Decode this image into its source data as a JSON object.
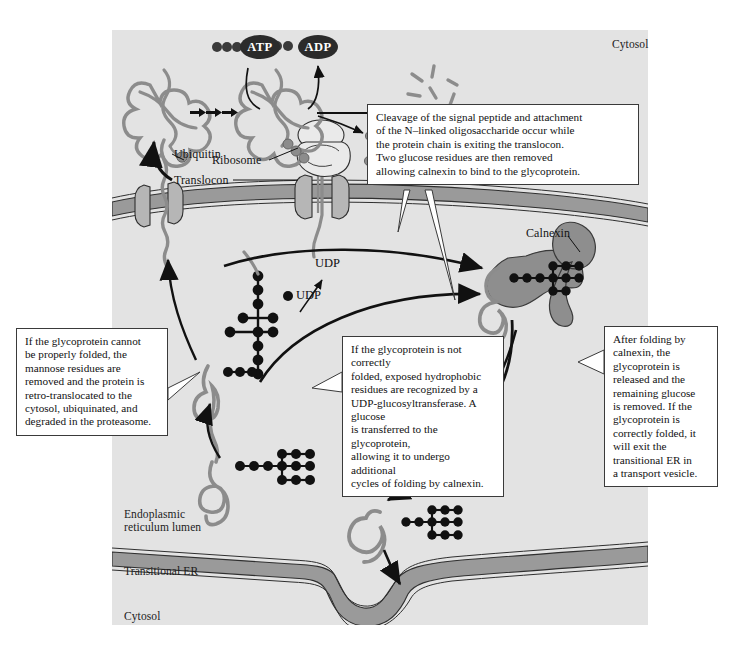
{
  "figure": {
    "panel_bg": "#e3e3e3",
    "membrane_fill": "#9a9a9a",
    "protein_stroke": "#8c8c8c",
    "calnexin_fill": "#8e8e8e",
    "sugar_color": "#111111",
    "line_color": "#111111"
  },
  "regions": [
    {
      "name": "cytosol-top",
      "label": "Cytosol"
    },
    {
      "name": "er-lumen",
      "label": "Endoplasmic\nreticulum lumen"
    },
    {
      "name": "transitional-er",
      "label": "Transitional ER"
    },
    {
      "name": "cytosol-bottom",
      "label": "Cytosol"
    }
  ],
  "parts": [
    {
      "name": "ubiquitin",
      "label": "Ubiquitin"
    },
    {
      "name": "ribosome",
      "label": "Ribosome"
    },
    {
      "name": "translocon",
      "label": "Translocon"
    },
    {
      "name": "calnexin",
      "label": "Calnexin"
    }
  ],
  "molecules": [
    {
      "name": "atp",
      "label": "ATP"
    },
    {
      "name": "adp",
      "label": "ADP"
    },
    {
      "name": "udp-free",
      "label": "UDP"
    },
    {
      "name": "udp-released",
      "label": "UDP"
    }
  ],
  "callouts": {
    "top": {
      "name": "callout-signal-peptide-cleavage",
      "lines": [
        "Cleavage of the signal peptide and attachment",
        "of the N–linked oligosaccharide occur while",
        "the protein chain is exiting the translocon.",
        "Two glucose residues are then removed",
        "allowing calnexin to bind to the glycoprotein."
      ],
      "text": "Cleavage of the signal peptide and attachment of the N–linked oligosaccharide occur while the protein chain is exiting the translocon. Two glucose residues are then removed allowing calnexin to bind to the glycoprotein."
    },
    "left": {
      "name": "callout-erad-degradation",
      "lines": [
        "If the glycoprotein cannot",
        "be properly folded, the",
        "mannose residues are",
        "removed and the protein is",
        "retro-translocated to the",
        "cytosol, ubiquinated, and",
        "degraded in the proteasome."
      ],
      "text": "If the glycoprotein cannot be properly folded, the mannose residues are removed and the protein is retro-translocated to the cytosol, ubiquinated, and degraded in the proteasome."
    },
    "center": {
      "name": "callout-udp-glucosyltransferase",
      "lines": [
        "If the glycoprotein is not correctly",
        "folded, exposed hydrophobic",
        "residues are recognized by a",
        "UDP-glucosyltransferase. A glucose",
        "is transferred to the glycoprotein,",
        "allowing it to undergo additional",
        "cycles of folding by calnexin."
      ],
      "text": "If the glycoprotein is not correctly folded, exposed hydrophobic residues are recognized by a UDP-glucosyltransferase. A glucose is transferred to the glycoprotein, allowing it to undergo additional cycles of folding by calnexin."
    },
    "right": {
      "name": "callout-transport-vesicle-exit",
      "lines": [
        "After folding by",
        "calnexin, the",
        "glycoprotein is",
        "released and the",
        "remaining glucose",
        "is removed. If the",
        "glycoprotein is",
        "correctly folded, it",
        "will exit the",
        "transitional ER in",
        "a transport vesicle."
      ],
      "text": "After folding by calnexin, the glycoprotein is released and the remaining glucose is removed. If the glycoprotein is correctly folded, it will exit the transitional ER in a transport vesicle."
    }
  }
}
